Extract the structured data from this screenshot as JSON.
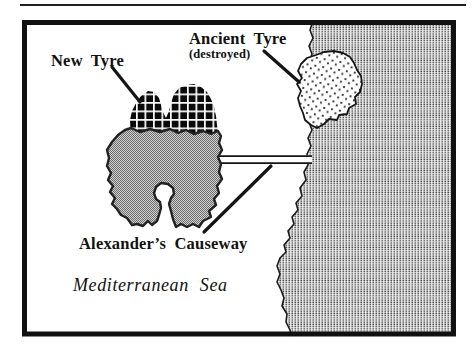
{
  "figure": {
    "type": "historical-map",
    "labels": {
      "new_tyre": "New Tyre",
      "ancient_tyre": "Ancient Tyre",
      "ancient_tyre_note": "(destroyed)",
      "causeway": "Alexander’s Causeway",
      "sea": "Mediterranean Sea"
    },
    "colors": {
      "ink": "#151515",
      "frame": "#111111",
      "sea_fill": "#ffffff",
      "mainland_dot": "#4a4a4a",
      "city_black": "#0a0a0a",
      "island_outline": "#222222",
      "site_dot": "#333333"
    }
  }
}
